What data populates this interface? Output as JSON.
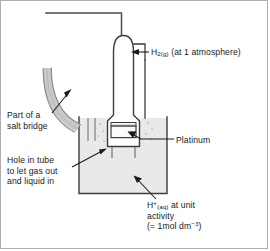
{
  "figure": {
    "type": "labelled-science-diagram"
  },
  "labels": {
    "hydrogen_gas": {
      "formula": "H",
      "sub": "2(g)",
      "rest": "(at 1 atmosphere)",
      "full_text": "H2(g) (at 1 atmosphere)"
    },
    "salt_bridge": {
      "line1": "Part of a",
      "line2": "salt bridge"
    },
    "platinum": {
      "text": "Platinum"
    },
    "hole_in_tube": {
      "line1": "Hole in tube",
      "line2": "to let gas out",
      "line3": "and liquid in"
    },
    "acid_solution": {
      "formula": "H",
      "sup": "+",
      "sub": "(aq)",
      "rest": " at unit",
      "line2": "activity",
      "line3_pre": "(= 1mol dm",
      "line3_sup": "−3",
      "line3_post": ")",
      "full_text": "H+(aq) at unit activity (= 1mol dm-3)"
    }
  },
  "parts": {
    "outer_frame": "figure-border",
    "gas_outlet_pipe": "gas-outlet-pipe",
    "glass_tube": "glass-tube",
    "beaker": "beaker",
    "solution": "solution",
    "platinum_electrode": "platinum-electrode",
    "salt_bridge_tube": "salt-bridge-tube",
    "bubbles": "gas-bubbles"
  },
  "colors": {
    "line": "#3c3c3c",
    "frame": "#aeaeae",
    "solution_fill": "#e8e8e8",
    "glass_fill": "#ffffff",
    "salt_bridge_stroke": "#9a9a9a",
    "salt_bridge_fill": "#dcdcdc",
    "text": "#1a1a1a",
    "platinum_fill": "#f2f2f2"
  }
}
